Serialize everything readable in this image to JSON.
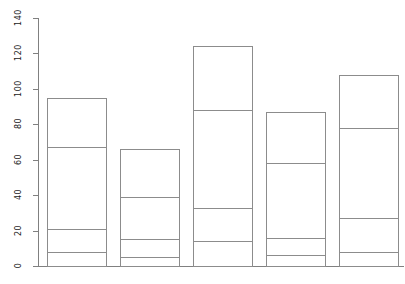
{
  "chart_data": {
    "type": "bar",
    "stacked": true,
    "title": "",
    "subtitle": "",
    "xlabel": "",
    "ylabel": "",
    "categories": [
      "1",
      "2",
      "3",
      "4",
      "5"
    ],
    "ylim": [
      0,
      140
    ],
    "yticks": [
      0,
      20,
      40,
      60,
      80,
      100,
      120,
      140
    ],
    "ytick_labels": [
      "0",
      "20",
      "40",
      "60",
      "80",
      "100",
      "120",
      "140"
    ],
    "xticks": [],
    "xtick_labels": [],
    "grid": false,
    "legend": false,
    "legend_position": "none",
    "series": [
      {
        "name": "series-1",
        "values": [
          8,
          5,
          14,
          6,
          8
        ]
      },
      {
        "name": "series-2",
        "values": [
          13,
          10,
          19,
          10,
          19
        ]
      },
      {
        "name": "series-3",
        "values": [
          46,
          24,
          55,
          42,
          51
        ]
      },
      {
        "name": "series-4",
        "values": [
          28,
          27,
          36,
          29,
          30
        ]
      }
    ],
    "stack_tops": [
      [
        8,
        21,
        67,
        95
      ],
      [
        5,
        15,
        39,
        66
      ],
      [
        14,
        33,
        88,
        124
      ],
      [
        6,
        16,
        58,
        87
      ],
      [
        8,
        27,
        78,
        108
      ]
    ],
    "totals": [
      95,
      66,
      124,
      87,
      108
    ],
    "colors": {
      "bar_fill": "#ffffff",
      "bar_border": "#8c8c8c",
      "axis": "#808080",
      "text": "#1a1a1a",
      "background": "#ffffff"
    }
  }
}
